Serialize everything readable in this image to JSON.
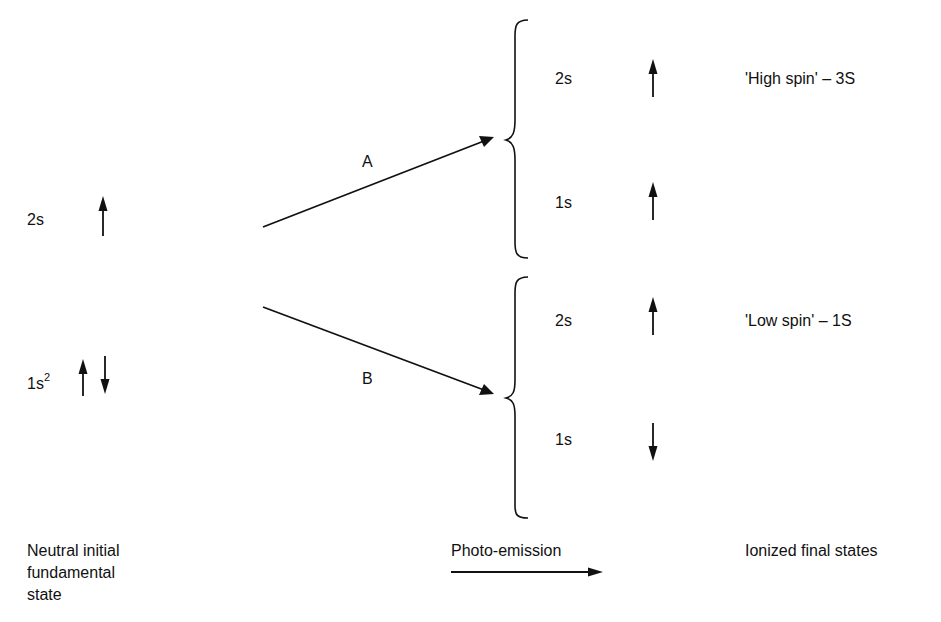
{
  "initial_state": {
    "levels": [
      {
        "orbital": "2s",
        "superscript": "",
        "spins": [
          "up"
        ]
      },
      {
        "orbital": "1s",
        "superscript": "2",
        "spins": [
          "up",
          "down"
        ]
      }
    ],
    "caption_lines": [
      "Neutral initial",
      "fundamental",
      "state"
    ]
  },
  "transitions": [
    {
      "label": "A",
      "target": "high-spin"
    },
    {
      "label": "B",
      "target": "low-spin"
    }
  ],
  "final_states": [
    {
      "id": "high-spin",
      "term": "'High spin' – 3S",
      "levels": [
        {
          "orbital": "2s",
          "spin": "up"
        },
        {
          "orbital": "1s",
          "spin": "up"
        }
      ]
    },
    {
      "id": "low-spin",
      "term": "'Low spin' – 1S",
      "levels": [
        {
          "orbital": "2s",
          "spin": "up"
        },
        {
          "orbital": "1s",
          "spin": "down"
        }
      ]
    }
  ],
  "process_label": "Photo-emission",
  "final_caption": "Ionized final states",
  "colors": {
    "ink": "#111111",
    "background": "#ffffff"
  }
}
